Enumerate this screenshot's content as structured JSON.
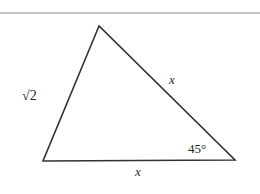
{
  "diagram": {
    "type": "triangle",
    "top_rule": {
      "y": 13,
      "x1": 0,
      "x2": 260,
      "color": "#888888"
    },
    "line_color": "#333333",
    "vertices": {
      "apex": [
        99,
        26
      ],
      "bottom_left": [
        43,
        161
      ],
      "bottom_right": [
        235,
        160
      ]
    },
    "labels": {
      "left_side": "√2",
      "right_side": "x",
      "bottom_side": "x",
      "angle_bottom_right": "45°"
    }
  }
}
